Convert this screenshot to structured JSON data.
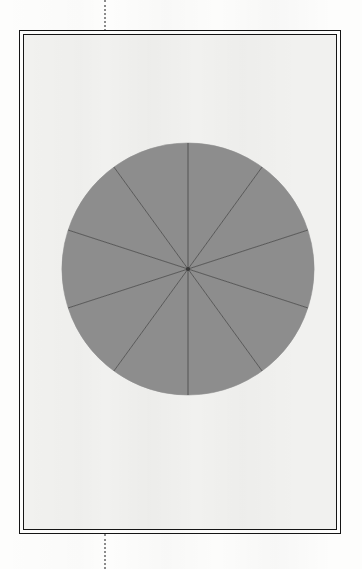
{
  "figure": {
    "background_color": "#fdfdfc",
    "plate_color": "#f1f1ef",
    "frame_color": "#151515",
    "frame": {
      "x": 19,
      "y": 30,
      "width": 322,
      "height": 504
    },
    "crop_guide": {
      "name": "vertical-registration-line",
      "style": "dotted",
      "color": "#8b8b8b",
      "x": 104
    }
  },
  "chart_data": {
    "type": "pie",
    "title": "",
    "subtitle": "",
    "xlabel": "",
    "ylabel": "",
    "grid": false,
    "legend": "none",
    "labels": [
      "1",
      "2",
      "3",
      "4",
      "5",
      "6",
      "7",
      "8",
      "9",
      "10"
    ],
    "values": [
      10,
      10,
      10,
      10,
      10,
      10,
      10,
      10,
      10,
      10
    ],
    "percentages": [
      10,
      10,
      10,
      10,
      10,
      10,
      10,
      10,
      10,
      10
    ],
    "slice_count": 10,
    "slice_angle_degrees": 36,
    "start_angle_degrees": 0,
    "total": 100,
    "colors": {
      "slice_fill": "#8d8d8d",
      "slice_edge": "#4a4a4a",
      "outline": "#8d8d8d"
    },
    "geometry": {
      "center_x": 183,
      "center_y": 264,
      "radius": 126,
      "diameter": 253
    },
    "annotations": []
  }
}
